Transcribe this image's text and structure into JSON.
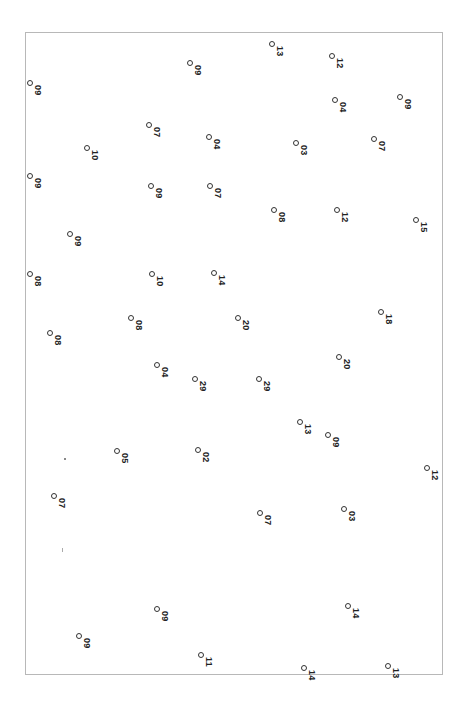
{
  "sheet": {
    "frame_color": "#b8b8b8",
    "marker_color": "#333333",
    "points": [
      {
        "x": 30,
        "y": 83,
        "label": "09"
      },
      {
        "x": 190,
        "y": 63,
        "label": "09"
      },
      {
        "x": 272,
        "y": 44,
        "label": "13"
      },
      {
        "x": 332,
        "y": 56,
        "label": "12"
      },
      {
        "x": 149,
        "y": 125,
        "label": "07"
      },
      {
        "x": 87,
        "y": 148,
        "label": "10"
      },
      {
        "x": 209,
        "y": 137,
        "label": "04"
      },
      {
        "x": 296,
        "y": 143,
        "label": "03"
      },
      {
        "x": 335,
        "y": 100,
        "label": "04"
      },
      {
        "x": 400,
        "y": 97,
        "label": "09"
      },
      {
        "x": 374,
        "y": 139,
        "label": "07"
      },
      {
        "x": 30,
        "y": 176,
        "label": "09"
      },
      {
        "x": 151,
        "y": 186,
        "label": "09"
      },
      {
        "x": 210,
        "y": 186,
        "label": "07"
      },
      {
        "x": 274,
        "y": 210,
        "label": "08"
      },
      {
        "x": 337,
        "y": 210,
        "label": "12"
      },
      {
        "x": 416,
        "y": 220,
        "label": "15"
      },
      {
        "x": 70,
        "y": 234,
        "label": "09"
      },
      {
        "x": 30,
        "y": 274,
        "label": "08"
      },
      {
        "x": 152,
        "y": 274,
        "label": "10"
      },
      {
        "x": 214,
        "y": 273,
        "label": "14"
      },
      {
        "x": 131,
        "y": 318,
        "label": "08"
      },
      {
        "x": 50,
        "y": 333,
        "label": "08"
      },
      {
        "x": 238,
        "y": 318,
        "label": "20"
      },
      {
        "x": 381,
        "y": 312,
        "label": "18"
      },
      {
        "x": 157,
        "y": 365,
        "label": "04"
      },
      {
        "x": 195,
        "y": 379,
        "label": "29"
      },
      {
        "x": 259,
        "y": 379,
        "label": "29"
      },
      {
        "x": 339,
        "y": 357,
        "label": "20"
      },
      {
        "x": 300,
        "y": 422,
        "label": "13"
      },
      {
        "x": 328,
        "y": 435,
        "label": "09"
      },
      {
        "x": 117,
        "y": 451,
        "label": "05"
      },
      {
        "x": 198,
        "y": 450,
        "label": "02"
      },
      {
        "x": 54,
        "y": 496,
        "label": "07"
      },
      {
        "x": 427,
        "y": 468,
        "label": "12"
      },
      {
        "x": 260,
        "y": 513,
        "label": "07"
      },
      {
        "x": 344,
        "y": 509,
        "label": "03"
      },
      {
        "x": 157,
        "y": 609,
        "label": "09"
      },
      {
        "x": 79,
        "y": 636,
        "label": "09"
      },
      {
        "x": 348,
        "y": 606,
        "label": "14"
      },
      {
        "x": 201,
        "y": 655,
        "label": "11"
      },
      {
        "x": 304,
        "y": 668,
        "label": "14"
      },
      {
        "x": 388,
        "y": 666,
        "label": "13"
      }
    ]
  }
}
